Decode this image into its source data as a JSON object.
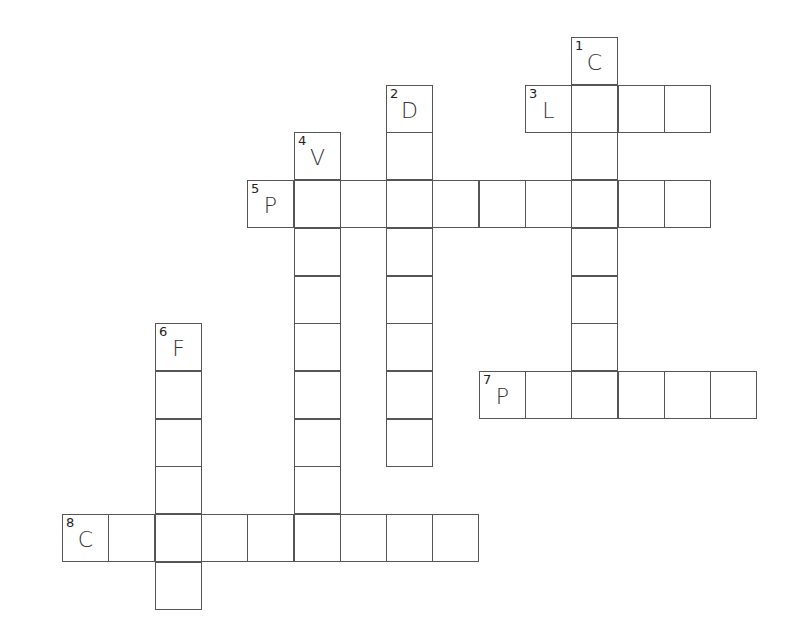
{
  "puzzle": {
    "type": "crossword",
    "cell_size": 46.5,
    "origin": {
      "x": 62,
      "y": 37
    },
    "words": [
      {
        "number": "1",
        "direction": "down",
        "col": 11,
        "row": 0,
        "length": 8,
        "first_letter": "C"
      },
      {
        "number": "2",
        "direction": "down",
        "col": 7,
        "row": 1,
        "length": 8,
        "first_letter": "D"
      },
      {
        "number": "3",
        "direction": "across",
        "col": 10,
        "row": 1,
        "length": 4,
        "first_letter": "L"
      },
      {
        "number": "4",
        "direction": "down",
        "col": 5,
        "row": 2,
        "length": 9,
        "first_letter": "V"
      },
      {
        "number": "5",
        "direction": "across",
        "col": 4,
        "row": 3,
        "length": 10,
        "first_letter": "P"
      },
      {
        "number": "6",
        "direction": "down",
        "col": 2,
        "row": 6,
        "length": 6,
        "first_letter": "F"
      },
      {
        "number": "7",
        "direction": "across",
        "col": 9,
        "row": 7,
        "length": 6,
        "first_letter": "P"
      },
      {
        "number": "8",
        "direction": "across",
        "col": 0,
        "row": 10,
        "length": 9,
        "first_letter": "C"
      }
    ]
  }
}
